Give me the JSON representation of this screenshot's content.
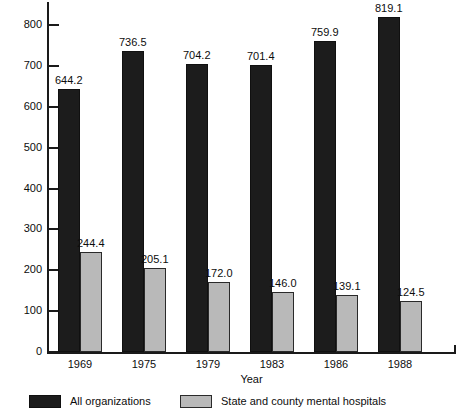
{
  "chart_data": {
    "type": "bar",
    "title": "",
    "xlabel": "Year",
    "ylabel": "",
    "categories": [
      "1969",
      "1975",
      "1979",
      "1983",
      "1986",
      "1988"
    ],
    "series": [
      {
        "name": "All organizations",
        "color": "#1c1c1c",
        "values": [
          644.2,
          736.5,
          704.2,
          701.4,
          759.9,
          819.1
        ],
        "labels": [
          "644.2",
          "736.5",
          "704.2",
          "701.4",
          "759.9",
          "819.1"
        ]
      },
      {
        "name": "State and county mental hospitals",
        "color": "#b9b9b9",
        "values": [
          244.4,
          205.1,
          172.0,
          146.0,
          139.1,
          124.5
        ],
        "labels": [
          "244.4",
          "205.1",
          "172.0",
          "146.0",
          "139.1",
          "124.5"
        ]
      }
    ],
    "ylim": [
      0,
      800
    ],
    "yticks": [
      0,
      100,
      200,
      300,
      400,
      500,
      600,
      700,
      800
    ],
    "ytick_labels": [
      "0",
      "100",
      "200",
      "300",
      "400",
      "500",
      "600",
      "700",
      "800"
    ],
    "grid": false,
    "legend_position": "bottom-left"
  },
  "legend": {
    "entries": [
      {
        "label": "All organizations",
        "swatch": "dark"
      },
      {
        "label": "State and county mental hospitals",
        "swatch": "light"
      }
    ]
  },
  "axes": {
    "x_title": "Year"
  }
}
